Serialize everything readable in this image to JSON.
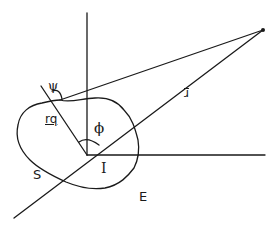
{
  "diagram": {
    "type": "geometric figure",
    "labels": {
      "psi": "ψ",
      "phi": "ϕ",
      "r": "r",
      "rq": "rq",
      "S": "S",
      "I": "I",
      "E": "E"
    },
    "stroke_color": "#1a1a1a",
    "background": "#ffffff"
  }
}
